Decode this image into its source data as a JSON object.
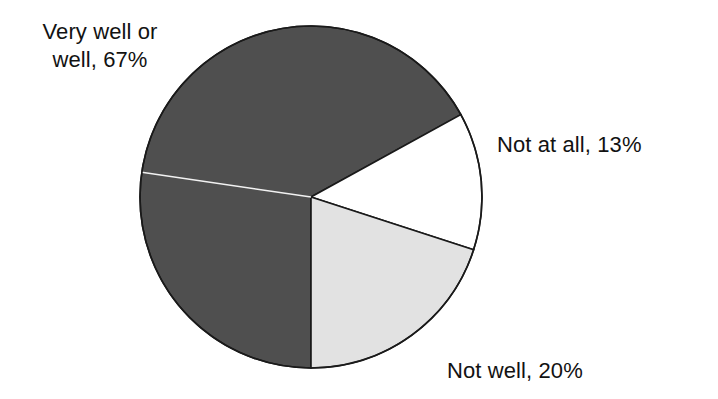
{
  "chart_data": {
    "type": "pie",
    "title": "",
    "subtitle": "",
    "xlabel": "",
    "ylabel": "",
    "grid": false,
    "legend_position": "none",
    "labels_inline": true,
    "total": 100,
    "unit": "%",
    "categories": [
      "Very well or well",
      "Not at all",
      "Not well"
    ],
    "values": [
      67,
      13,
      20
    ],
    "slices": [
      {
        "name": "Very well or well",
        "value": 67,
        "value_text": "67%",
        "label": "Very well or well, 67%",
        "label_line_1": "Very well or",
        "label_line_2": "well, 67%",
        "color": "#4f4f4f",
        "start_angle_deg": 90,
        "end_angle_deg": 331.2,
        "label_position": "top-left"
      },
      {
        "name": "Not at all",
        "value": 13,
        "value_text": "13%",
        "label": "Not at all, 13%",
        "color": "#ffffff",
        "start_angle_deg": 331.2,
        "end_angle_deg": 28.8,
        "label_position": "right"
      },
      {
        "name": "Not well",
        "value": 20,
        "value_text": "20%",
        "label": "Not well, 20%",
        "color": "#e2e2e2",
        "start_angle_deg": 28.8,
        "end_angle_deg": 90,
        "label_position": "bottom-right"
      }
    ],
    "geometry": {
      "center_x": 311,
      "center_y": 197,
      "radius": 171,
      "outline_color": "#1a1a1a",
      "outline_width": 1.6
    }
  },
  "labels": {
    "very_well": {
      "line1": "Very well or",
      "line2": "well, 67%"
    },
    "not_at_all": "Not at all, 13%",
    "not_well": "Not well, 20%"
  }
}
